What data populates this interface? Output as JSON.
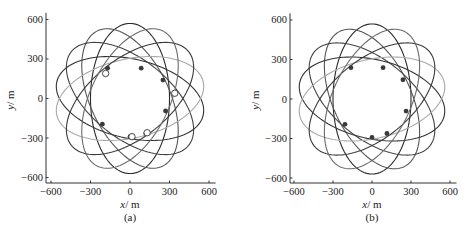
{
  "chart_data": [
    {
      "type": "line",
      "panel_label": "(a)",
      "title": "",
      "xlabel": "x/m",
      "ylabel": "y/m",
      "xlim": [
        -650,
        650
      ],
      "ylim": [
        -650,
        650
      ],
      "xticks": [
        -600,
        -300,
        0,
        300,
        600
      ],
      "yticks": [
        -600,
        -300,
        0,
        300,
        600
      ],
      "xtick_labels": [
        "−600",
        "−300",
        "0",
        "300",
        "600"
      ],
      "ytick_labels": [
        "−600",
        "−300",
        "0",
        "300",
        "600"
      ],
      "grid": false,
      "legend": null,
      "series": [
        {
          "name": "trajectory-1",
          "shape": "ellipse",
          "a": 570,
          "b": 300,
          "rotation_deg": 90,
          "color": "#2a2a2a"
        },
        {
          "name": "trajectory-2",
          "shape": "ellipse",
          "a": 570,
          "b": 300,
          "rotation_deg": 115.7,
          "color": "#555555"
        },
        {
          "name": "trajectory-3",
          "shape": "ellipse",
          "a": 570,
          "b": 300,
          "rotation_deg": 141.4,
          "color": "#444444"
        },
        {
          "name": "trajectory-4",
          "shape": "ellipse",
          "a": 570,
          "b": 300,
          "rotation_deg": 167.1,
          "color": "#333333"
        },
        {
          "name": "trajectory-5",
          "shape": "ellipse",
          "a": 570,
          "b": 300,
          "rotation_deg": 12.9,
          "color": "#a8a8a8"
        },
        {
          "name": "trajectory-6",
          "shape": "ellipse",
          "a": 570,
          "b": 300,
          "rotation_deg": 38.6,
          "color": "#3a3a3a"
        },
        {
          "name": "trajectory-7",
          "shape": "ellipse",
          "a": 570,
          "b": 300,
          "rotation_deg": 64.3,
          "color": "#6a6a6a"
        }
      ],
      "markers_filled": [
        {
          "x": -170,
          "y": 230
        },
        {
          "x": 85,
          "y": 230
        },
        {
          "x": 250,
          "y": 140
        },
        {
          "x": 270,
          "y": -95
        },
        {
          "x": -210,
          "y": -195
        },
        {
          "x": 0,
          "y": -290
        },
        {
          "x": 120,
          "y": -265
        }
      ],
      "markers_open": [
        {
          "x": -185,
          "y": 190
        },
        {
          "x": 340,
          "y": 40
        },
        {
          "x": 15,
          "y": -290
        },
        {
          "x": 130,
          "y": -260
        }
      ]
    },
    {
      "type": "line",
      "panel_label": "(b)",
      "title": "",
      "xlabel": "x/m",
      "ylabel": "y/m",
      "xlim": [
        -650,
        650
      ],
      "ylim": [
        -650,
        650
      ],
      "xticks": [
        -600,
        -300,
        0,
        300,
        600
      ],
      "yticks": [
        -600,
        -300,
        0,
        300,
        600
      ],
      "xtick_labels": [
        "−600",
        "−300",
        "0",
        "300",
        "600"
      ],
      "ytick_labels": [
        "−600",
        "−300",
        "0",
        "300",
        "600"
      ],
      "grid": false,
      "legend": null,
      "series": [
        {
          "name": "trajectory-1",
          "shape": "ellipse",
          "a": 570,
          "b": 300,
          "rotation_deg": 90,
          "color": "#2a2a2a"
        },
        {
          "name": "trajectory-2",
          "shape": "ellipse",
          "a": 570,
          "b": 300,
          "rotation_deg": 115.7,
          "color": "#555555"
        },
        {
          "name": "trajectory-3",
          "shape": "ellipse",
          "a": 570,
          "b": 300,
          "rotation_deg": 141.4,
          "color": "#444444"
        },
        {
          "name": "trajectory-4",
          "shape": "ellipse",
          "a": 570,
          "b": 300,
          "rotation_deg": 167.1,
          "color": "#333333"
        },
        {
          "name": "trajectory-5",
          "shape": "ellipse",
          "a": 570,
          "b": 300,
          "rotation_deg": 12.9,
          "color": "#a8a8a8"
        },
        {
          "name": "trajectory-6",
          "shape": "ellipse",
          "a": 570,
          "b": 300,
          "rotation_deg": 38.6,
          "color": "#3a3a3a"
        },
        {
          "name": "trajectory-7",
          "shape": "ellipse",
          "a": 570,
          "b": 300,
          "rotation_deg": 64.3,
          "color": "#6a6a6a"
        }
      ],
      "markers_filled": [
        {
          "x": -162,
          "y": 238
        },
        {
          "x": 85,
          "y": 238
        },
        {
          "x": 238,
          "y": 146
        },
        {
          "x": 262,
          "y": -92
        },
        {
          "x": -208,
          "y": -192
        },
        {
          "x": 0,
          "y": -292
        },
        {
          "x": 115,
          "y": -262
        }
      ],
      "markers_open": []
    }
  ],
  "panels": [
    {
      "label": "(a)",
      "xlabel_var": "x",
      "xlabel_unit": "/ m",
      "ylabel_var": "y",
      "ylabel_unit": "/ m"
    },
    {
      "label": "(b)",
      "xlabel_var": "x",
      "xlabel_unit": "/ m",
      "ylabel_var": "y",
      "ylabel_unit": "/ m"
    }
  ]
}
